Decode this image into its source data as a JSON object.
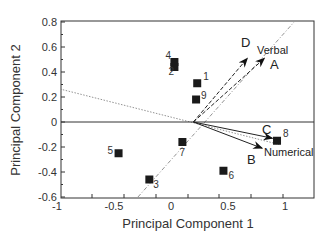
{
  "chart_data": {
    "type": "scatter",
    "title": "",
    "xlabel": "Principal Component 1",
    "ylabel": "Principal Component 2",
    "xlim": [
      -1,
      1.2
    ],
    "ylim": [
      -0.6,
      0.8
    ],
    "x_ticks": [
      -1,
      -0.5,
      0,
      0.5,
      1
    ],
    "x_tick_labels": [
      "-1",
      "-0.5",
      "0",
      "0.5",
      "1"
    ],
    "y_ticks": [
      -0.6,
      -0.4,
      -0.2,
      0,
      0.2,
      0.4,
      0.6,
      0.8
    ],
    "y_tick_labels": [
      "-0.6",
      "-0.4",
      "-0.2",
      "0",
      "0.2",
      "0.4",
      "0.6",
      "0.8"
    ],
    "grid": false,
    "zero_line": true,
    "points": [
      {
        "label": "1",
        "x": 0.23,
        "y": 0.31
      },
      {
        "label": "2",
        "x": 0.03,
        "y": 0.44
      },
      {
        "label": "3",
        "x": -0.19,
        "y": -0.46
      },
      {
        "label": "4",
        "x": 0.03,
        "y": 0.48
      },
      {
        "label": "5",
        "x": -0.46,
        "y": -0.25
      },
      {
        "label": "6",
        "x": 0.46,
        "y": -0.39
      },
      {
        "label": "7",
        "x": 0.1,
        "y": -0.16
      },
      {
        "label": "8",
        "x": 0.93,
        "y": -0.15
      },
      {
        "label": "9",
        "x": 0.22,
        "y": 0.18
      }
    ],
    "arrows": [
      {
        "label": "A",
        "from": [
          0.17,
          0
        ],
        "to": [
          0.82,
          0.51
        ],
        "style": "dashed"
      },
      {
        "label": "B",
        "from": [
          0.17,
          0
        ],
        "to": [
          0.8,
          -0.21
        ],
        "style": "solid"
      },
      {
        "label": "C",
        "from": [
          0.17,
          0
        ],
        "to": [
          0.89,
          -0.13
        ],
        "style": "solid"
      },
      {
        "label": "D",
        "from": [
          0.17,
          0
        ],
        "to": [
          0.67,
          0.51
        ],
        "style": "dashed"
      }
    ],
    "variable_axes": [
      {
        "label": "Verbal",
        "from": [
          -0.29,
          -0.6
        ],
        "to": [
          1.08,
          0.8
        ],
        "style": "dash-dot"
      },
      {
        "label": "Numerical",
        "from": [
          -1,
          0.27
        ],
        "to": [
          0.95,
          -0.18
        ],
        "style": "dotted"
      }
    ],
    "annotations": [
      "A",
      "B",
      "C",
      "D",
      "Verbal",
      "Numerical"
    ]
  }
}
